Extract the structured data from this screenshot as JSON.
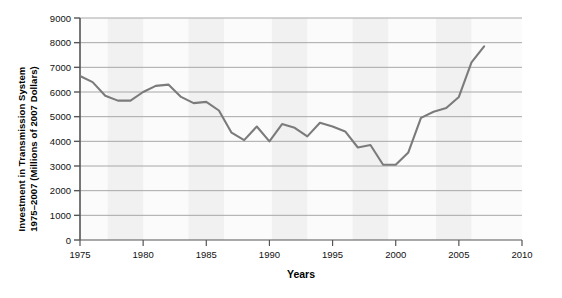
{
  "chart_data": {
    "type": "line",
    "title": "",
    "xlabel": "Years",
    "ylabel": "Investment in Transmission System 1975–2007 (Millions of 2007 Dollars)",
    "ylabel_line1": "Investment in Transmission System",
    "ylabel_line2": "1975–2007 (Millions of 2007 Dollars)",
    "xlim": [
      1975,
      2010
    ],
    "ylim": [
      0,
      9000
    ],
    "x_ticks": [
      1975,
      1980,
      1985,
      1990,
      1995,
      2000,
      2005,
      2010
    ],
    "x_tick_labels": [
      "1975",
      "1980",
      "1985",
      "1990",
      "1995",
      "2000",
      "2005",
      "2010"
    ],
    "y_ticks": [
      0,
      1000,
      2000,
      3000,
      4000,
      5000,
      6000,
      7000,
      8000,
      9000
    ],
    "y_tick_labels": [
      "0",
      "1000",
      "2000",
      "3000",
      "4000",
      "5000",
      "6000",
      "7000",
      "8000",
      "9000"
    ],
    "grid": "horizontal",
    "legend": "none",
    "line_color": "#7b7b7b",
    "grid_color": "#a8a8a8",
    "axis_color": "#555555",
    "band_color": "#efefef",
    "plot_background": "#fbfbfb",
    "series": [
      {
        "name": "Investment in Transmission System",
        "x": [
          1975,
          1976,
          1977,
          1978,
          1979,
          1980,
          1981,
          1982,
          1983,
          1984,
          1985,
          1986,
          1987,
          1988,
          1989,
          1990,
          1991,
          1992,
          1993,
          1994,
          1995,
          1996,
          1997,
          1998,
          1999,
          2000,
          2001,
          2002,
          2003,
          2004,
          2005,
          2006,
          2007
        ],
        "values": [
          6650,
          6400,
          5850,
          5650,
          5650,
          6000,
          6250,
          6300,
          5800,
          5550,
          5600,
          5250,
          4350,
          4050,
          4600,
          4000,
          4700,
          4550,
          4200,
          4750,
          4600,
          4400,
          3750,
          3850,
          3050,
          3050,
          3550,
          4950,
          5200,
          5350,
          5800,
          7200,
          7850
        ]
      }
    ]
  }
}
